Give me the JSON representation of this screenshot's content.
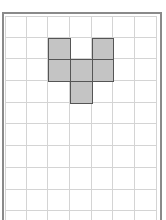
{
  "diagram": {
    "type": "grid-shape",
    "columns": 7,
    "rows": 10,
    "cell_size_px": 21.7,
    "colors": {
      "frame": "#8a8a8a",
      "grid_line": "#d4d4d4",
      "shaded_fill": "#c4c4c4",
      "shaded_border": "#555555",
      "background": "#ffffff"
    },
    "shaded_cells": [
      {
        "col": 2,
        "row": 1
      },
      {
        "col": 4,
        "row": 1
      },
      {
        "col": 2,
        "row": 2
      },
      {
        "col": 3,
        "row": 2
      },
      {
        "col": 4,
        "row": 2
      },
      {
        "col": 3,
        "row": 3
      }
    ]
  }
}
